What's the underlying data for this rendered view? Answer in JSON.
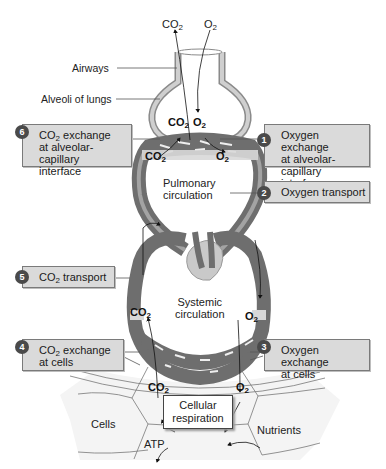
{
  "labels": {
    "airways": "Airways",
    "alveoli": "Alveoli of lungs",
    "pulmonary_line1": "Pulmonary",
    "pulmonary_line2": "circulation",
    "systemic_line1": "Systemic",
    "systemic_line2": "circulation",
    "cells": "Cells",
    "atp": "ATP",
    "nutrients": "Nutrients",
    "cellular_respiration_line1": "Cellular",
    "cellular_respiration_line2": "respiration"
  },
  "gases": {
    "co2_base": "CO",
    "co2_sub": "2",
    "o2_base": "O",
    "o2_sub": "2"
  },
  "steps": [
    {
      "number": "1",
      "text": "Oxygen exchange\nat alveolar-capillary\ninterface"
    },
    {
      "number": "2",
      "text": "Oxygen transport"
    },
    {
      "number": "3",
      "text": "Oxygen exchange\nat cells"
    },
    {
      "number": "4",
      "prefix": "CO",
      "sub": "2",
      "suffix": " exchange",
      "line2": "at cells"
    },
    {
      "number": "5",
      "prefix": "CO",
      "sub": "2",
      "suffix": " transport"
    },
    {
      "number": "6",
      "prefix": "CO",
      "sub": "2",
      "suffix": " exchange",
      "line2": "at alveolar-capillary",
      "line3": "interface"
    }
  ],
  "colors": {
    "box_fill": "#dadada",
    "box_border": "#7a7a7a",
    "badge": "#4a4a4a",
    "vessel": "#6e6e6e",
    "vessel_light": "#a3a3a3",
    "heart": "#c9c9c9"
  }
}
